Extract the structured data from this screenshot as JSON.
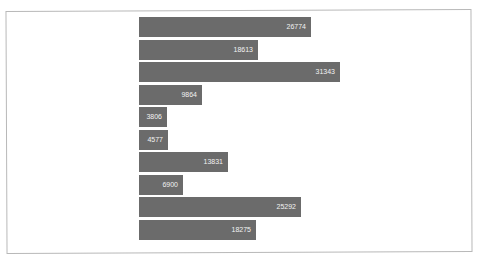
{
  "chart_data": {
    "type": "bar",
    "orientation": "horizontal",
    "title": "",
    "xlabel": "",
    "ylabel": "",
    "categories": [
      "1",
      "2",
      "3",
      "4",
      "5",
      "6",
      "7",
      "8",
      "9",
      "10"
    ],
    "values": [
      26774,
      18613,
      31343,
      9864,
      3806,
      4577,
      13831,
      6900,
      25292,
      18275
    ],
    "labels": [
      "26774",
      "18613",
      "31343",
      "9864",
      "3806",
      "4577",
      "13831",
      "6900",
      "25292",
      "18275"
    ],
    "bar_color": "#6b6b6b",
    "label_color": "#f2f2f2",
    "grid": false,
    "legend": false,
    "xlim": [
      0,
      31343
    ]
  }
}
